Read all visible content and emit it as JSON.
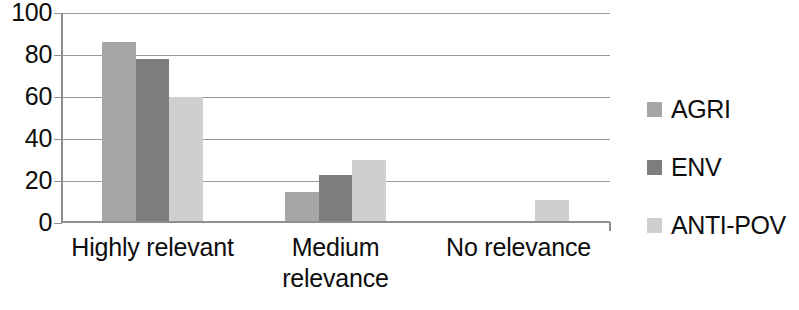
{
  "chart_data": {
    "type": "bar",
    "title": "",
    "subtitle": "",
    "xlabel": "",
    "ylabel": "",
    "categories": [
      "Highly relevant",
      "Medium relevance",
      "No relevance"
    ],
    "category_lines": [
      [
        "Highly relevant"
      ],
      [
        "Medium",
        "relevance"
      ],
      [
        "No relevance"
      ]
    ],
    "series": [
      {
        "name": "AGRI",
        "values": [
          86,
          15,
          0
        ],
        "color": "#a6a6a6"
      },
      {
        "name": "ENV",
        "values": [
          78,
          23,
          0
        ],
        "color": "#7d7d7d"
      },
      {
        "name": "ANTI-POV",
        "values": [
          60,
          30,
          11
        ],
        "color": "#cfcfcf"
      }
    ],
    "ylim": [
      0,
      100
    ],
    "yticks": [
      0,
      20,
      40,
      60,
      80,
      100
    ],
    "ytick_labels": [
      "0",
      "20",
      "40",
      "60",
      "80",
      "100"
    ],
    "grid": true,
    "grid_axis": "y",
    "legend_position": "right",
    "bar_group_gap": 0.45,
    "axis_color": "#8f8f8f",
    "grid_color": "#9a9a9a",
    "text_color": "#0d0d0d",
    "background": "#ffffff"
  }
}
